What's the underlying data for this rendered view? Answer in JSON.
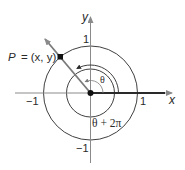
{
  "diagram": {
    "type": "unit-circle-coterminal-angle",
    "axes": {
      "x_label": "x",
      "y_label": "y",
      "x_ticks": [
        {
          "value": -1,
          "label": "−1"
        },
        {
          "value": 1,
          "label": "1"
        }
      ],
      "y_ticks": [
        {
          "value": 1,
          "label": "1"
        },
        {
          "value": -1,
          "label": "−1"
        }
      ]
    },
    "point": {
      "label": "P = (x, y)",
      "name_part": "P",
      "coords_part": "= (x, y)"
    },
    "angles": {
      "theta_label": "θ",
      "coterminal_label": "θ + 2π"
    },
    "colors": {
      "line": "#2a2a2a",
      "ray": "#7a7a7a",
      "axis_arrow": "#8a8a8a",
      "text": "#2a2a2a"
    }
  }
}
